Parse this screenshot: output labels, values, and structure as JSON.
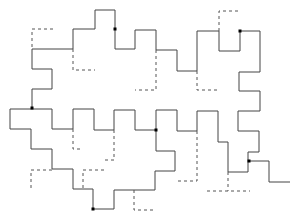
{
  "diagram": {
    "title": "",
    "colors": {
      "solid": "#444444",
      "dashed": "#555555",
      "dot": "#000000",
      "background": "#ffffff"
    },
    "solid_paths": [
      "M32,49 L73,49 L73,29 L95,29 L95,10 L115,10 L115,49 L135,49 L135,30 L156,30 L156,50 L177,50 L177,71 L197,71 L197,31 L219,31 L219,51 L240,51 L240,31 L260,31 L260,72 L239,72 L239,91 L260,91 L260,111 L238,111 L238,131 L259,131 L259,152 L248,152 L248,172 L228,172 L228,142 L218,142 L218,111 L197,111 L197,131 L177,131 L177,110 L156,110 L156,151 L175,151 L175,171 L155,171 L155,190 L114,190 L114,209 L93,209 L93,189 L73,189 L73,169 L52,169 L52,149 L31,149 L31,129 L10,129 L10,109 L52,109 L52,129 L73,129 L73,109 L94,109 L94,130 L114,130 L114,110 L135,110 L135,130 L156,130",
      "M32,49 L32,69 L52,69 L52,89 L32,89 L32,109",
      "M249,161 L269,161 L269,182 L290,182"
    ],
    "dashed_paths": [
      "M53,29 L32,29 L32,49",
      "M73,49 L73,70 L95,70",
      "M156,50 L156,90 L135,90",
      "M219,31 L219,11 L240,11",
      "M197,71 L197,90 L219,90",
      "M73,129 L73,149 L82,149",
      "M114,130 L114,160 L104,160",
      "M52,170 L31,170 L31,190",
      "M104,170 L83,170 L83,190",
      "M134,190 L134,210 L155,210",
      "M197,131 L197,181 L175,181",
      "M228,172 L228,191",
      "M207,191 L250,191"
    ],
    "dots": [
      {
        "x": 115,
        "y": 29
      },
      {
        "x": 240,
        "y": 31
      },
      {
        "x": 32,
        "y": 108
      },
      {
        "x": 156,
        "y": 130
      },
      {
        "x": 249,
        "y": 161
      },
      {
        "x": 93,
        "y": 209
      }
    ]
  }
}
